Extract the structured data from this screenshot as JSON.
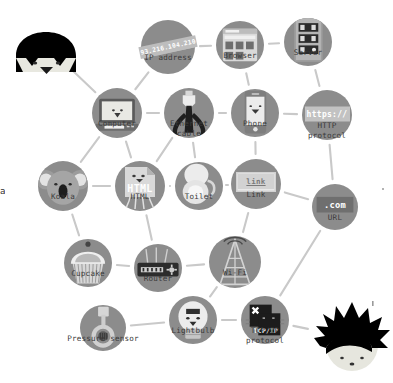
{
  "page": {
    "kind": "concept-map",
    "background_color": "#ffffff",
    "node_color": "#8c8c8c",
    "edge_color": "#c9c9c9",
    "label_color": "#3a3a3a",
    "left_edge_clipped_text": "a"
  },
  "nodes": [
    {
      "id": "ip-address",
      "label": "IP address",
      "badge": "93.216.104.210",
      "x": 168,
      "y": 47,
      "r": 27
    },
    {
      "id": "browser",
      "label": "Browser",
      "badge": "",
      "x": 240,
      "y": 45,
      "r": 24
    },
    {
      "id": "server",
      "label": "Server",
      "badge": "",
      "x": 308,
      "y": 42,
      "r": 24
    },
    {
      "id": "computer",
      "label": "Computer",
      "badge": "",
      "x": 117,
      "y": 113,
      "r": 25
    },
    {
      "id": "ethernet-cable",
      "label": "Ethernet\ncable",
      "badge": "",
      "x": 189,
      "y": 113,
      "r": 25
    },
    {
      "id": "phone",
      "label": "Phone",
      "badge": "",
      "x": 255,
      "y": 113,
      "r": 24
    },
    {
      "id": "http-protocol",
      "label": "HTTP\nprotocol",
      "badge": "https://",
      "x": 327,
      "y": 115,
      "r": 25
    },
    {
      "id": "koala",
      "label": "Koala",
      "badge": "",
      "x": 63,
      "y": 186,
      "r": 25
    },
    {
      "id": "html",
      "label": "HTML",
      "badge": "HTML",
      "x": 140,
      "y": 186,
      "r": 25
    },
    {
      "id": "toilet",
      "label": "Toilet",
      "badge": "",
      "x": 199,
      "y": 186,
      "r": 24
    },
    {
      "id": "link",
      "label": "Link",
      "badge": "link",
      "x": 256,
      "y": 184,
      "r": 25
    },
    {
      "id": "url",
      "label": "URL",
      "badge": ".com",
      "x": 335,
      "y": 207,
      "r": 23
    },
    {
      "id": "cupcake",
      "label": "Cupcake",
      "badge": "",
      "x": 88,
      "y": 263,
      "r": 24
    },
    {
      "id": "router",
      "label": "Router",
      "badge": "",
      "x": 158,
      "y": 268,
      "r": 24
    },
    {
      "id": "wifi",
      "label": "Wi-Fi",
      "badge": "",
      "x": 235,
      "y": 262,
      "r": 26
    },
    {
      "id": "pressure-sensor",
      "label": "Pressure sensor",
      "badge": "",
      "x": 103,
      "y": 328,
      "r": 23
    },
    {
      "id": "lightbulb",
      "label": "Lightbulb",
      "badge": "",
      "x": 193,
      "y": 320,
      "r": 24
    },
    {
      "id": "tcp-ip-protocol",
      "label": "TCP/IP\nprotocol",
      "badge": "TCP/IP",
      "x": 265,
      "y": 320,
      "r": 24
    }
  ],
  "characters": [
    {
      "id": "character-bowlcut",
      "name": "kid-with-bowl-cut-hair",
      "x": 46,
      "y": 45,
      "w": 72,
      "h": 62
    },
    {
      "id": "character-spiky",
      "name": "kid-with-spiky-hair",
      "x": 352,
      "y": 338,
      "w": 80,
      "h": 80
    }
  ],
  "edges": [
    {
      "from": "character-bowlcut",
      "to": "computer"
    },
    {
      "from": "ip-address",
      "to": "computer"
    },
    {
      "from": "ip-address",
      "to": "browser"
    },
    {
      "from": "browser",
      "to": "server"
    },
    {
      "from": "browser",
      "to": "phone"
    },
    {
      "from": "server",
      "to": "http-protocol"
    },
    {
      "from": "computer",
      "to": "ethernet-cable"
    },
    {
      "from": "ethernet-cable",
      "to": "phone"
    },
    {
      "from": "phone",
      "to": "http-protocol"
    },
    {
      "from": "computer",
      "to": "koala"
    },
    {
      "from": "computer",
      "to": "html"
    },
    {
      "from": "ethernet-cable",
      "to": "html"
    },
    {
      "from": "ethernet-cable",
      "to": "toilet"
    },
    {
      "from": "phone",
      "to": "link"
    },
    {
      "from": "http-protocol",
      "to": "url"
    },
    {
      "from": "koala",
      "to": "html"
    },
    {
      "from": "html",
      "to": "toilet"
    },
    {
      "from": "toilet",
      "to": "link"
    },
    {
      "from": "link",
      "to": "url"
    },
    {
      "from": "link",
      "to": "wifi"
    },
    {
      "from": "koala",
      "to": "cupcake"
    },
    {
      "from": "html",
      "to": "router"
    },
    {
      "from": "cupcake",
      "to": "router"
    },
    {
      "from": "router",
      "to": "wifi"
    },
    {
      "from": "url",
      "to": "tcp-ip-protocol"
    },
    {
      "from": "wifi",
      "to": "lightbulb"
    },
    {
      "from": "pressure-sensor",
      "to": "lightbulb"
    },
    {
      "from": "lightbulb",
      "to": "tcp-ip-protocol"
    },
    {
      "from": "tcp-ip-protocol",
      "to": "character-spiky"
    }
  ]
}
